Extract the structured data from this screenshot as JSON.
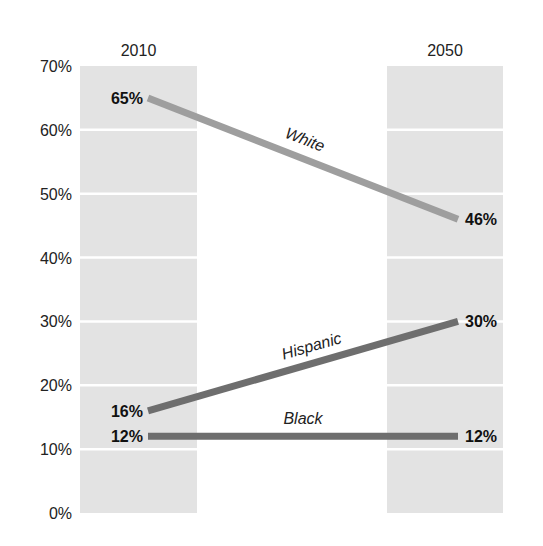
{
  "chart_data": {
    "type": "line",
    "title": "",
    "xlabel": "",
    "ylabel": "",
    "categories": [
      "2010",
      "2050"
    ],
    "ylim": [
      0,
      70
    ],
    "yticks": [
      "0%",
      "10%",
      "20%",
      "30%",
      "40%",
      "50%",
      "60%",
      "70%"
    ],
    "grid": true,
    "legend_position": "inline labels",
    "series": [
      {
        "name": "White",
        "values": [
          65,
          46
        ],
        "labels": [
          "65%",
          "46%"
        ],
        "color": "#9e9e9e"
      },
      {
        "name": "Hispanic",
        "values": [
          16,
          30
        ],
        "labels": [
          "16%",
          "30%"
        ],
        "color": "#6e6e6e"
      },
      {
        "name": "Black",
        "values": [
          12,
          12
        ],
        "labels": [
          "12%",
          "12%"
        ],
        "color": "#6e6e6e"
      }
    ],
    "column_band_color": "#e3e3e3"
  }
}
